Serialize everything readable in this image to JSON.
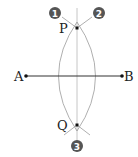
{
  "diagram": {
    "points": {
      "A": {
        "label": "A",
        "x": 26,
        "y": 76
      },
      "B": {
        "label": "B",
        "x": 122,
        "y": 76
      },
      "P": {
        "label": "P",
        "x": 77,
        "y": 28
      },
      "Q": {
        "label": "Q",
        "x": 77,
        "y": 125
      }
    },
    "steps": [
      {
        "label": "1",
        "x": 55,
        "y": 13
      },
      {
        "label": "2",
        "x": 99,
        "y": 13
      },
      {
        "label": "3",
        "x": 77,
        "y": 146
      }
    ],
    "colors": {
      "segment": "#333333",
      "arc": "#9a9a9a",
      "bisector": "#b0b0b0",
      "badge": "#555555"
    }
  }
}
